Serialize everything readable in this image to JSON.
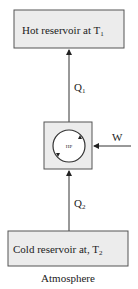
{
  "diagram": {
    "hot_reservoir": {
      "label": "Hot reservoir at T",
      "subscript": "1"
    },
    "cold_reservoir": {
      "label": "Cold reservoir at, T",
      "subscript": "2"
    },
    "heat_pump": {
      "label": "HP"
    },
    "q1": {
      "label": "Q",
      "subscript": "1"
    },
    "q2": {
      "label": "Q",
      "subscript": "2"
    },
    "work": {
      "label": "W"
    },
    "caption": "Atmosphere"
  },
  "colors": {
    "box_fill": "#ececec",
    "stroke": "#555555",
    "text": "#222222"
  }
}
